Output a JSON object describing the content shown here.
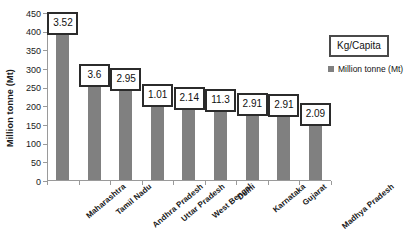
{
  "chart_data": {
    "type": "bar",
    "title": "",
    "xlabel": "",
    "ylabel": "Million tonne (Mt)",
    "ylim": [
      0,
      450
    ],
    "ytick_step": 50,
    "yticks": [
      "450",
      "400",
      "350",
      "300",
      "250",
      "200",
      "150",
      "100",
      "50",
      "0"
    ],
    "grid": false,
    "legend_position": "right",
    "legend_title": "Kg/Capita",
    "series_name": "Million tonne (Mt)",
    "bar_color": "#808080",
    "categories": [
      "Maharashtra",
      "Tamil Nadu",
      "Andhra Pradesh",
      "Uttar Pradesh",
      "West Bengal",
      "Delhi",
      "Karnataka",
      "Gujarat",
      "Madhya Pradesh"
    ],
    "values": [
      400,
      260,
      250,
      205,
      197,
      192,
      182,
      179,
      155
    ],
    "point_labels": [
      "3.52",
      "3.6",
      "2.95",
      "1.01",
      "2.14",
      "11.3",
      "2.91",
      "2.91",
      "2.09"
    ],
    "point_label_unit": "Kg/Capita"
  },
  "legend": {
    "title": "Kg/Capita",
    "series_label": "Million tonne (Mt)"
  },
  "axes": {
    "y_title": "Million tonne (Mt)"
  }
}
